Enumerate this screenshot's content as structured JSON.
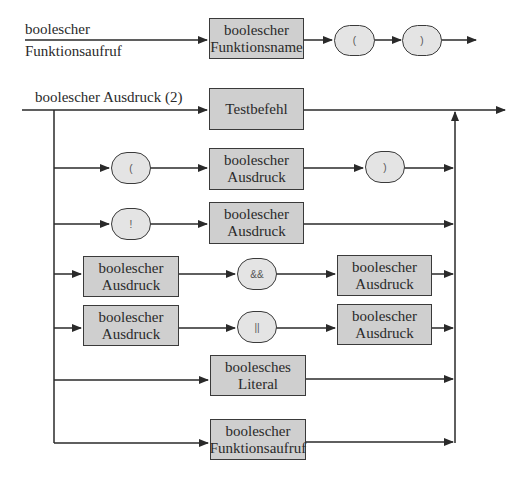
{
  "diagram": {
    "function_call": {
      "label_line1": "boolescher",
      "label_line2": "Funktionsaufruf",
      "name_box": {
        "line1": "boolescher",
        "line2": "Funktionsname"
      },
      "open_paren": "(",
      "close_paren": ")"
    },
    "expression": {
      "label": "boolescher Ausdruck (2)",
      "alternatives": {
        "test": {
          "line1": "Testbefehl"
        },
        "paren": {
          "open": "(",
          "box": {
            "line1": "boolescher",
            "line2": "Ausdruck"
          },
          "close": ")"
        },
        "negation": {
          "op": "!",
          "box": {
            "line1": "boolescher",
            "line2": "Ausdruck"
          }
        },
        "and": {
          "left": {
            "line1": "boolescher",
            "line2": "Ausdruck"
          },
          "op": "&&",
          "right": {
            "line1": "boolescher",
            "line2": "Ausdruck"
          }
        },
        "or": {
          "left": {
            "line1": "boolescher",
            "line2": "Ausdruck"
          },
          "op": "||",
          "right": {
            "line1": "boolescher",
            "line2": "Ausdruck"
          }
        },
        "literal": {
          "line1": "boolesches",
          "line2": "Literal"
        },
        "function_call": {
          "line1": "boolescher",
          "line2": "Funktionsaufruf"
        }
      }
    }
  }
}
